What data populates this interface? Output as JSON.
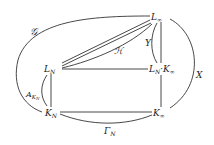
{
  "diagram": {
    "nodes": {
      "L_inf": {
        "label": "L",
        "sub": "∞"
      },
      "L_N": {
        "label": "L",
        "sub": "N"
      },
      "LN_Kinf": {
        "label_a": "L",
        "sub_a": "N",
        "dot": "·",
        "label_b": "K",
        "sub_b": "∞"
      },
      "K_N": {
        "label": "K",
        "sub": "N"
      },
      "K_inf": {
        "label": "K",
        "sub": "∞"
      }
    },
    "edge_labels": {
      "G": "𝒢",
      "H": "ℋ",
      "Y": "Y",
      "X": "X",
      "A": "A",
      "A_sub": "K",
      "A_subsub": "N",
      "Gamma": "Γ",
      "Gamma_sub": "N"
    },
    "colors": {
      "stroke": "#333333",
      "text": "#222222",
      "background": "#ffffff"
    }
  }
}
